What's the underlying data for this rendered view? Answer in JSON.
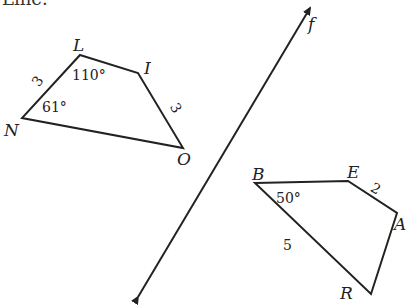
{
  "header_fragment": "Line.",
  "line": {
    "label": "f",
    "from": [
      135,
      302
    ],
    "to": [
      313,
      3
    ]
  },
  "quad_left": {
    "name": "LION",
    "vertices": {
      "L": {
        "label": "L",
        "x": 80,
        "y": 55
      },
      "I": {
        "label": "I",
        "x": 138,
        "y": 73
      },
      "O": {
        "label": "O",
        "x": 183,
        "y": 148
      },
      "N": {
        "label": "N",
        "x": 22,
        "y": 118
      }
    },
    "angle_L": "110°",
    "angle_N": "61°",
    "side_LN": "3",
    "side_IO": "3"
  },
  "quad_right": {
    "name": "BEAR",
    "vertices": {
      "B": {
        "label": "B",
        "x": 255,
        "y": 183
      },
      "E": {
        "label": "E",
        "x": 348,
        "y": 181
      },
      "A": {
        "label": "A",
        "x": 397,
        "y": 213
      },
      "R": {
        "label": "R",
        "x": 371,
        "y": 294
      }
    },
    "angle_B": "50°",
    "side_EA": "2",
    "side_BR": "5"
  }
}
